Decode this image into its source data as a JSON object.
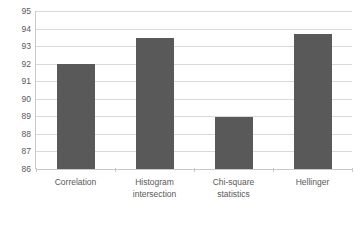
{
  "chart_data": {
    "type": "bar",
    "title": "",
    "subtitle": "",
    "xlabel": "",
    "ylabel": "",
    "categories": [
      "Correlation",
      "Histogram\nintersection",
      "Chi-square\nstatistics",
      "Hellinger"
    ],
    "values": [
      92.0,
      93.45,
      88.95,
      93.7
    ],
    "ylim": [
      86,
      95
    ],
    "yticks": [
      86,
      87,
      88,
      89,
      90,
      91,
      92,
      93,
      94,
      95
    ],
    "ytick_labels": [
      "86",
      "87",
      "88",
      "89",
      "90",
      "91",
      "92",
      "93",
      "94",
      "95"
    ],
    "grid": true,
    "grid_axis": "y",
    "legend": false,
    "legend_position": "none",
    "annotations": [],
    "series": [
      {
        "name": "",
        "values": [
          92.0,
          93.45,
          88.95,
          93.7
        ]
      }
    ]
  },
  "style": {
    "bar_color": "#595959",
    "gridline_color": "#d9d9d9",
    "axis_color": "#c8c8c8",
    "text_color": "#595959",
    "background_color": "#ffffff"
  }
}
